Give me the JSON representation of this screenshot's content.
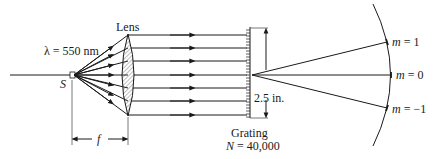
{
  "diagram": {
    "labels": {
      "wavelength": "λ = 550 nm",
      "source": "S",
      "lens": "Lens",
      "focal_length": "f",
      "grating_width": "2.5 in.",
      "grating": "Grating",
      "grating_lines": "N = 40,000",
      "order_plus1": "m = 1",
      "order_zero": "m = 0",
      "order_minus1": "m = −1"
    },
    "parameters": {
      "wavelength_nm": 550,
      "grating_width_in": 2.5,
      "grating_lines_N": 40000,
      "diffraction_orders": [
        1,
        0,
        -1
      ]
    },
    "components": [
      "point source S",
      "converging lens (collimator) at distance f",
      "collimated parallel rays",
      "transmission grating",
      "curved observation screen"
    ]
  }
}
